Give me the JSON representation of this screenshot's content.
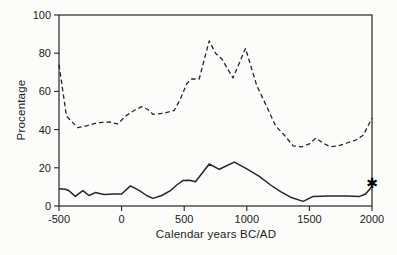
{
  "figure": {
    "background": "#fcfcfa",
    "ink": "#262626",
    "text_color": "#1b1b1b"
  },
  "chart_data": {
    "type": "line",
    "title": "",
    "xlabel": "Calendar years BC/AD",
    "ylabel": "Procentage",
    "xlim": [
      -500,
      2000
    ],
    "ylim": [
      0,
      100
    ],
    "x_ticks": [
      -500,
      0,
      500,
      1000,
      1500,
      2000
    ],
    "y_ticks": [
      0,
      20,
      40,
      60,
      80,
      100
    ],
    "grid": false,
    "frame": "box",
    "legend": "none",
    "series": [
      {
        "name": "upper-series-dashed",
        "style": "dashed",
        "points": [
          [
            -500,
            74
          ],
          [
            -440,
            47
          ],
          [
            -350,
            41
          ],
          [
            -280,
            42
          ],
          [
            -200,
            43.5
          ],
          [
            -100,
            44
          ],
          [
            -30,
            43
          ],
          [
            30,
            47
          ],
          [
            100,
            50
          ],
          [
            160,
            52
          ],
          [
            210,
            50.5
          ],
          [
            250,
            48
          ],
          [
            330,
            48.5
          ],
          [
            420,
            50
          ],
          [
            470,
            56
          ],
          [
            520,
            64
          ],
          [
            560,
            66.5
          ],
          [
            620,
            66.5
          ],
          [
            700,
            86.5
          ],
          [
            750,
            80
          ],
          [
            800,
            77
          ],
          [
            890,
            67
          ],
          [
            990,
            82.5
          ],
          [
            1080,
            63
          ],
          [
            1160,
            52
          ],
          [
            1230,
            42
          ],
          [
            1300,
            37
          ],
          [
            1370,
            31.5
          ],
          [
            1440,
            31
          ],
          [
            1500,
            32.5
          ],
          [
            1550,
            35.5
          ],
          [
            1620,
            32.5
          ],
          [
            1670,
            31
          ],
          [
            1730,
            31.5
          ],
          [
            1800,
            33
          ],
          [
            1870,
            34.5
          ],
          [
            1930,
            37
          ],
          [
            2000,
            46
          ]
        ]
      },
      {
        "name": "lower-series-solid",
        "style": "solid",
        "points": [
          [
            -500,
            9
          ],
          [
            -450,
            8.8
          ],
          [
            -420,
            8
          ],
          [
            -370,
            5
          ],
          [
            -310,
            8
          ],
          [
            -260,
            5.5
          ],
          [
            -210,
            7
          ],
          [
            -140,
            6
          ],
          [
            -60,
            6.3
          ],
          [
            0,
            6.3
          ],
          [
            70,
            10.5
          ],
          [
            140,
            8.2
          ],
          [
            200,
            5.5
          ],
          [
            250,
            4
          ],
          [
            320,
            5.5
          ],
          [
            390,
            8
          ],
          [
            440,
            11
          ],
          [
            490,
            13.3
          ],
          [
            540,
            13.5
          ],
          [
            590,
            12.7
          ],
          [
            700,
            22
          ],
          [
            780,
            19.2
          ],
          [
            900,
            23
          ],
          [
            1000,
            19.5
          ],
          [
            1100,
            15.5
          ],
          [
            1190,
            11
          ],
          [
            1270,
            7.5
          ],
          [
            1350,
            4.6
          ],
          [
            1450,
            2.4
          ],
          [
            1530,
            5
          ],
          [
            1650,
            5.2
          ],
          [
            1800,
            5.3
          ],
          [
            1900,
            5
          ],
          [
            1950,
            6.3
          ],
          [
            2000,
            10.3
          ]
        ]
      }
    ],
    "annotations": [
      {
        "name": "asterisk-marker",
        "glyph": "✱",
        "x": 2000,
        "y": 11.8
      }
    ]
  }
}
